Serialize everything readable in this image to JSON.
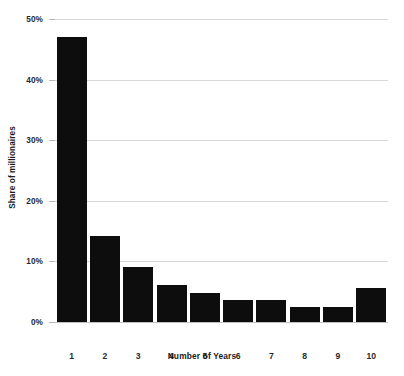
{
  "chart_data": {
    "type": "bar",
    "title": "",
    "xlabel": "Number of Years",
    "ylabel": "Share of millionaires",
    "categories": [
      "1",
      "2",
      "3",
      "4",
      "5",
      "6",
      "7",
      "8",
      "9",
      "10"
    ],
    "values": [
      47,
      14.2,
      9.1,
      6.1,
      4.8,
      3.7,
      3.7,
      2.5,
      2.5,
      5.6
    ],
    "ylim": [
      0,
      50
    ],
    "yticks": [
      0,
      10,
      20,
      30,
      40,
      50
    ],
    "ytick_labels": [
      "0%",
      "10%",
      "20%",
      "30%",
      "40%",
      "50%"
    ],
    "grid": true,
    "legend": false,
    "bar_color": "#0d0d0d",
    "background_color": "#ffffff",
    "gridline_color": "#d8d8d8"
  }
}
